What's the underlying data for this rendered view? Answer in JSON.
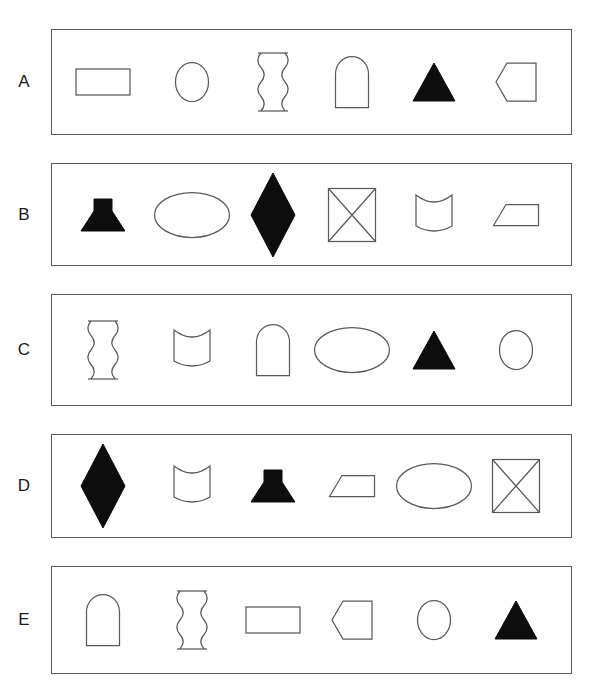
{
  "figure": {
    "background_color": "#ffffff",
    "stroke_color": "#5a5a5a",
    "fill_color": "#0d0d0d",
    "label_color": "#1a1a1a",
    "partial_top_text": ""
  },
  "shape_names": {
    "rectangle": "rectangle",
    "ellipse": "ellipse",
    "circle": "circle",
    "wavy-column": "wavy-sided column",
    "arch": "arch",
    "filled-triangle": "filled triangle",
    "left-pentagon": "left-pointing pentagon",
    "filled-anvil": "filled anvil",
    "wide-ellipse": "wide ellipse",
    "filled-diamond": "filled diamond",
    "crossed-square": "crossed square",
    "concave-barrel": "concave barrel",
    "trapezoid": "trapezoid"
  },
  "rows": [
    {
      "label": "A",
      "shapes": [
        {
          "type": "rectangle",
          "filled": false
        },
        {
          "type": "circle",
          "filled": false
        },
        {
          "type": "wavy-column",
          "filled": false
        },
        {
          "type": "arch",
          "filled": false
        },
        {
          "type": "filled-triangle",
          "filled": true
        },
        {
          "type": "left-pentagon",
          "filled": false
        }
      ]
    },
    {
      "label": "B",
      "shapes": [
        {
          "type": "filled-anvil",
          "filled": true
        },
        {
          "type": "wide-ellipse",
          "filled": false
        },
        {
          "type": "filled-diamond",
          "filled": true
        },
        {
          "type": "crossed-square",
          "filled": false
        },
        {
          "type": "concave-barrel",
          "filled": false
        },
        {
          "type": "trapezoid",
          "filled": false
        }
      ]
    },
    {
      "label": "C",
      "shapes": [
        {
          "type": "wavy-column",
          "filled": false
        },
        {
          "type": "concave-barrel",
          "filled": false
        },
        {
          "type": "arch",
          "filled": false
        },
        {
          "type": "wide-ellipse",
          "filled": false
        },
        {
          "type": "filled-triangle",
          "filled": true
        },
        {
          "type": "circle",
          "filled": false
        }
      ]
    },
    {
      "label": "D",
      "shapes": [
        {
          "type": "filled-diamond",
          "filled": true
        },
        {
          "type": "concave-barrel",
          "filled": false
        },
        {
          "type": "filled-anvil",
          "filled": true
        },
        {
          "type": "trapezoid",
          "filled": false
        },
        {
          "type": "wide-ellipse",
          "filled": false
        },
        {
          "type": "crossed-square",
          "filled": false
        }
      ]
    },
    {
      "label": "E",
      "shapes": [
        {
          "type": "arch",
          "filled": false
        },
        {
          "type": "wavy-column",
          "filled": false
        },
        {
          "type": "rectangle",
          "filled": false
        },
        {
          "type": "left-pentagon",
          "filled": false
        },
        {
          "type": "circle",
          "filled": false
        },
        {
          "type": "filled-triangle",
          "filled": true
        }
      ]
    }
  ],
  "layout": {
    "box_left": 51,
    "box_right": 572,
    "row_tops": [
      29,
      163,
      294,
      434,
      566
    ],
    "row_heights": [
      106,
      103,
      112,
      104,
      108
    ],
    "label_x": 24,
    "slot_centers": [
      103,
      192,
      273,
      352,
      434,
      516
    ]
  }
}
